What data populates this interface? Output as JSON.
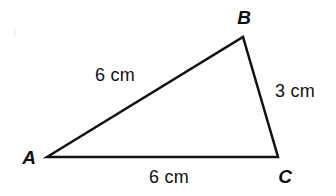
{
  "figure": {
    "type": "geometry-diagram",
    "shape": "triangle",
    "background_color": "#ffffff",
    "stroke_color": "#111111",
    "stroke_width": 2.5,
    "width": 336,
    "height": 196
  },
  "vertices": [
    {
      "id": "A",
      "label": "A",
      "x": 47,
      "y": 157,
      "label_x": 29,
      "label_y": 157
    },
    {
      "id": "B",
      "label": "B",
      "x": 243,
      "y": 37,
      "label_x": 244,
      "label_y": 17
    },
    {
      "id": "C",
      "label": "C",
      "x": 278,
      "y": 157,
      "label_x": 285,
      "label_y": 176
    }
  ],
  "sides": [
    {
      "id": "AB",
      "from": "A",
      "to": "B",
      "length_label": "6 cm",
      "label_x": 115,
      "label_y": 75
    },
    {
      "id": "BC",
      "from": "B",
      "to": "C",
      "length_label": "3 cm",
      "label_x": 295,
      "label_y": 91
    },
    {
      "id": "AC",
      "from": "A",
      "to": "C",
      "length_label": "6 cm",
      "label_x": 169,
      "label_y": 177
    }
  ]
}
